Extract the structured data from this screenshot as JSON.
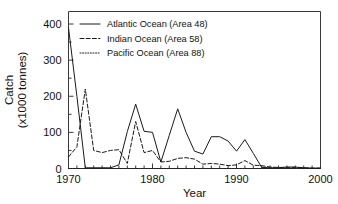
{
  "figure": {
    "background": "#ffffff",
    "ink_color": "#1a1a1a"
  },
  "chart_data": {
    "type": "line",
    "title": "",
    "xlabel": "Year",
    "ylabel_line1": "Catch",
    "ylabel_line2": "(x1000 tonnes)",
    "xlim": [
      1970,
      2000
    ],
    "ylim": [
      0,
      430
    ],
    "grid": false,
    "legend_position": "top-left-inside",
    "x_ticks_major": [
      1970,
      1980,
      1990,
      2000
    ],
    "x_tick_labels": [
      "1970",
      "1980",
      "1990",
      "2000"
    ],
    "x_minor_tick_interval": 1,
    "y_ticks_major": [
      0,
      100,
      200,
      300,
      400
    ],
    "y_tick_labels": [
      "0",
      "100",
      "200",
      "300",
      "400"
    ],
    "y_minor_tick_interval": 50,
    "x": [
      1970,
      1971,
      1972,
      1973,
      1974,
      1975,
      1976,
      1977,
      1978,
      1979,
      1980,
      1981,
      1982,
      1983,
      1984,
      1985,
      1986,
      1987,
      1988,
      1989,
      1990,
      1991,
      1992,
      1993,
      1994,
      1995,
      1996,
      1997,
      1998,
      1999,
      2000
    ],
    "series": [
      {
        "name": "Atlantic Ocean (Area 48)",
        "style": "solid",
        "legend_label": "Atlantic Ocean (Area 48)",
        "values": [
          390,
          200,
          2,
          2,
          2,
          2,
          10,
          102,
          178,
          103,
          100,
          18,
          92,
          165,
          100,
          48,
          40,
          88,
          88,
          76,
          48,
          80,
          42,
          3,
          2,
          2,
          4,
          4,
          2,
          1,
          1
        ]
      },
      {
        "name": "Indian Ocean (Area 58)",
        "style": "dashed",
        "legend_label": "Indian Ocean (Area 58)",
        "values": [
          32,
          60,
          220,
          50,
          44,
          50,
          52,
          14,
          130,
          44,
          50,
          18,
          20,
          28,
          30,
          26,
          12,
          14,
          12,
          8,
          10,
          22,
          9,
          8,
          4,
          3,
          3,
          3,
          2,
          1,
          1
        ]
      },
      {
        "name": "Pacific Ocean (Area 88)",
        "style": "dotted",
        "legend_label": "Pacific Ocean (Area 88)",
        "values": [
          0,
          0,
          0,
          0,
          0,
          0,
          0,
          0,
          0,
          0,
          0,
          0,
          0,
          0,
          0,
          0,
          0,
          0,
          0,
          0,
          0,
          0,
          0,
          0,
          0,
          0,
          0,
          0,
          0,
          0,
          0
        ]
      }
    ]
  }
}
